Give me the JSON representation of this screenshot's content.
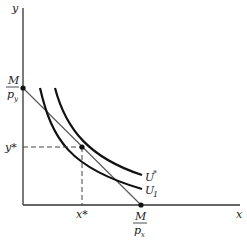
{
  "diagram": {
    "type": "indifference-curve-budget-line",
    "axes": {
      "x_label": "x",
      "y_label": "y"
    },
    "budget_line": {
      "y_intercept_label": {
        "num": "M",
        "den": "p",
        "sub": "y"
      },
      "x_intercept_label": {
        "num": "M",
        "den": "p",
        "sub": "x"
      }
    },
    "curves": [
      {
        "name": "U*",
        "label_main": "U",
        "label_sup": "*"
      },
      {
        "name": "U1",
        "label_main": "U",
        "label_sub": "1"
      }
    ],
    "optimum": {
      "x_label": "x*",
      "y_label": "y*"
    }
  }
}
